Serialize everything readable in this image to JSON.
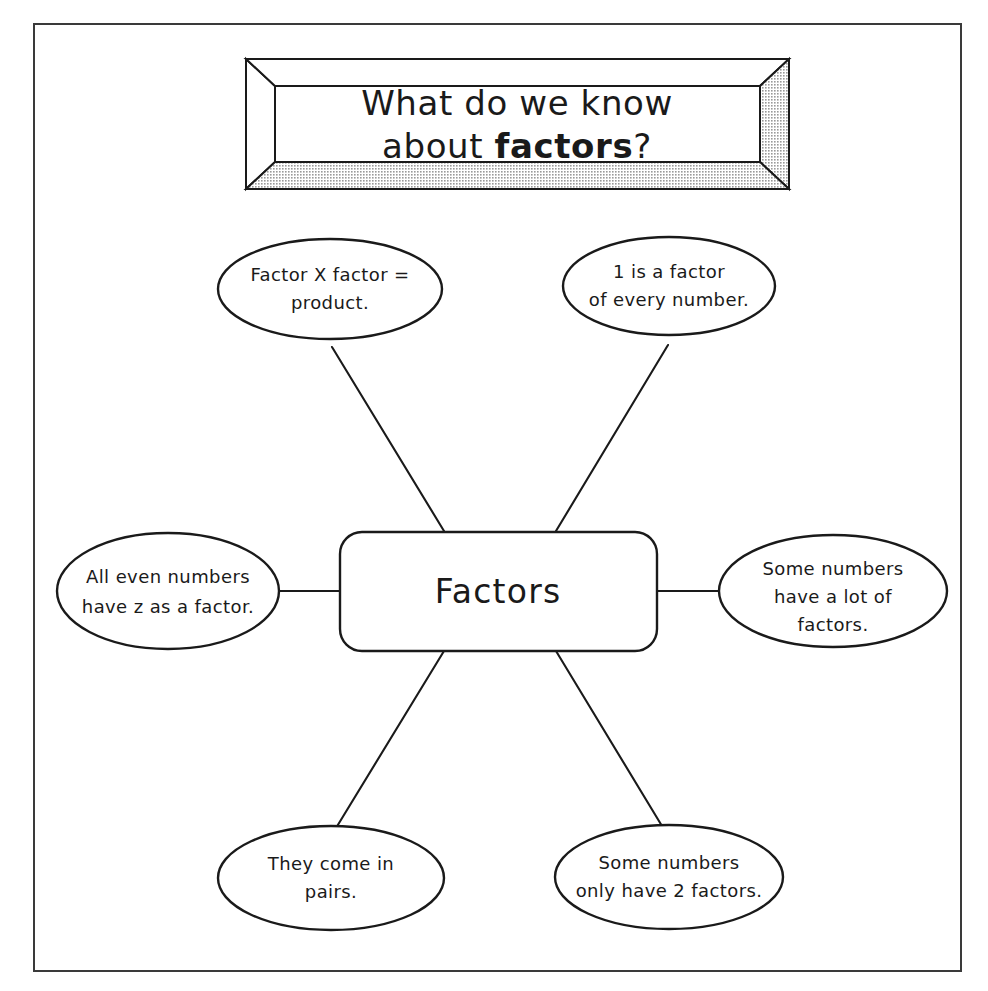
{
  "page": {
    "background_color": "#ffffff",
    "border_color": "#3a3a3a",
    "ink_color": "#1a1a1a"
  },
  "title_banner": {
    "name": "title-frame",
    "line1": "What do we know",
    "line2_prefix": "about ",
    "line2_bold": "factors",
    "line2_suffix": "?",
    "frame_fill": "#ffffff",
    "frame_shade": "#b8b8b8"
  },
  "center_node": {
    "label": "Factors"
  },
  "bubbles": [
    {
      "id": "factor-times-factor",
      "lines": [
        {
          "text": "Factor X factor ="
        },
        {
          "text": "product."
        }
      ]
    },
    {
      "id": "one-is-a-factor",
      "lines": [
        {
          "text": "1 is a factor"
        },
        {
          "text": "of every number."
        }
      ]
    },
    {
      "id": "even-numbers-have-two",
      "lines": [
        {
          "pre": "All ",
          "bold": "even",
          "post": " numbers"
        },
        {
          "text": "have z as a factor."
        }
      ]
    },
    {
      "id": "some-have-many-factors",
      "lines": [
        {
          "text": "Some numbers"
        },
        {
          "text": "have a lot of"
        },
        {
          "text": "factors."
        }
      ]
    },
    {
      "id": "come-in-pairs",
      "lines": [
        {
          "text": "They come in"
        },
        {
          "text": "pairs."
        }
      ]
    },
    {
      "id": "some-have-two-factors",
      "lines": [
        {
          "text": "Some numbers"
        },
        {
          "text": "only have 2 factors."
        }
      ]
    }
  ]
}
